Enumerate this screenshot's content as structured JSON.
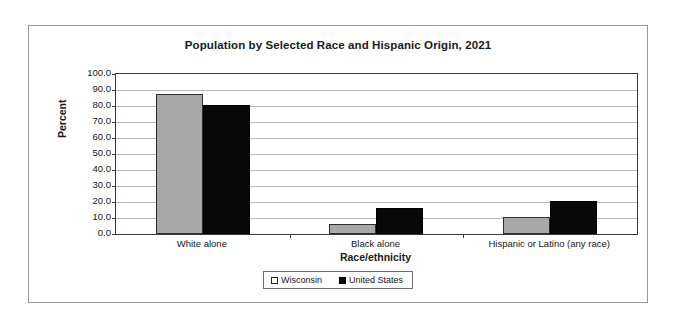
{
  "chart_data": {
    "type": "bar",
    "title": "Population by Selected Race and Hispanic Origin, 2021",
    "xlabel": "Race/ethnicity",
    "ylabel": "Percent",
    "categories": [
      "White alone",
      "Black alone",
      "Hispanic or Latino (any race)"
    ],
    "series": [
      {
        "name": "Wisconsin",
        "color": "#a8a8a8",
        "values": [
          87.5,
          6.5,
          10.5
        ]
      },
      {
        "name": "United States",
        "color": "#080808",
        "values": [
          80.5,
          16.0,
          20.5
        ]
      }
    ],
    "ylim": [
      0,
      100
    ],
    "ytick_step": 10,
    "ytick_labels": [
      "100.0",
      "90.0",
      "80.0",
      "70.0",
      "60.0",
      "50.0",
      "40.0",
      "30.0",
      "20.0",
      "10.0",
      "0.0"
    ],
    "grid": true,
    "legend_position": "bottom-center"
  }
}
